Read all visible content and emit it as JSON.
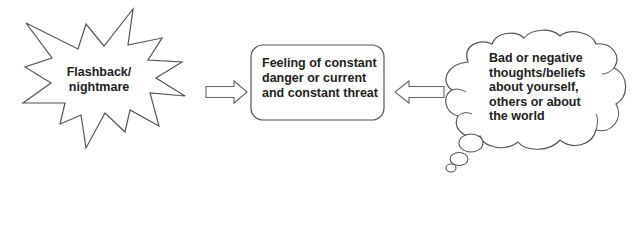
{
  "diagram": {
    "nodes": [
      {
        "id": "flashback",
        "shape": "starburst",
        "lines": [
          "Flashback/",
          "nightmare"
        ]
      },
      {
        "id": "danger",
        "shape": "rounded-rectangle",
        "lines": [
          "Feeling of constant",
          "danger or current",
          "and constant threat"
        ]
      },
      {
        "id": "thoughts",
        "shape": "thought-cloud",
        "lines": [
          "Bad or negative",
          "thoughts/beliefs",
          "about yourself,",
          "others or about",
          "the world"
        ]
      }
    ],
    "edges": [
      {
        "from": "flashback",
        "to": "danger",
        "style": "hollow-block-arrow",
        "direction": "right"
      },
      {
        "from": "thoughts",
        "to": "danger",
        "style": "hollow-block-arrow",
        "direction": "left"
      }
    ],
    "colors": {
      "stroke": "#555555",
      "fill": "#ffffff",
      "text": "#222222"
    }
  }
}
